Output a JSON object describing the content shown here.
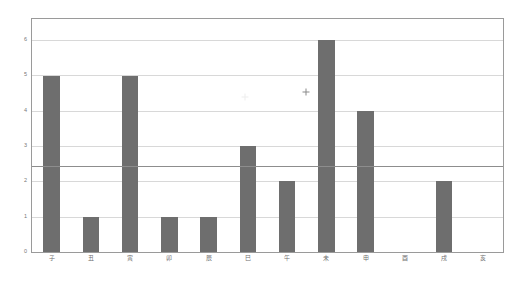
{
  "chart_data": {
    "type": "bar",
    "title": "",
    "subtitle": "",
    "xlabel": "",
    "ylabel": "",
    "categories": [
      "子",
      "丑",
      "寅",
      "卯",
      "辰",
      "巳",
      "午",
      "未",
      "申",
      "酉",
      "戌",
      "亥"
    ],
    "values": [
      5,
      1,
      5,
      1,
      1,
      3,
      2,
      6,
      4,
      0,
      2,
      0
    ],
    "series": [
      {
        "name": "count",
        "values": [
          5,
          1,
          5,
          1,
          1,
          3,
          2,
          6,
          4,
          0,
          2,
          0
        ]
      }
    ],
    "ylim": [
      0,
      6.6
    ],
    "yticks": [
      0,
      1,
      2,
      3,
      4,
      5,
      6
    ],
    "ytick_labels": [
      "0",
      "1",
      "2",
      "3",
      "4",
      "5",
      "6"
    ],
    "grid": true,
    "legend": null,
    "legend_position": "none",
    "bar_color": "#6e6e6e",
    "grid_color": "#d8d8d8",
    "frame_color": "#9a9a9a",
    "background_color": "#ffffff",
    "annotations": [
      {
        "name": "reference-line",
        "type": "hline",
        "y": 2.45,
        "color": "#8d8d8d"
      },
      {
        "name": "plus-marker",
        "type": "marker",
        "glyph": "+",
        "x_index": 7,
        "x_offset": -0.52,
        "y": 4.52,
        "color": "#8a8a8a"
      },
      {
        "name": "faint-marker",
        "type": "marker",
        "glyph": "+",
        "x_index": 5,
        "x_offset": -0.08,
        "y": 4.38,
        "color": "#ededed"
      }
    ]
  }
}
